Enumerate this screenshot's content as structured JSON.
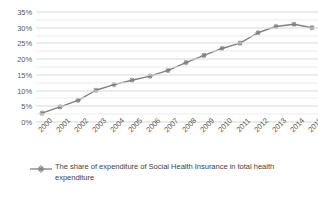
{
  "chart_data": {
    "type": "line",
    "title": "",
    "subtitle": "",
    "xlabel": "",
    "ylabel": "",
    "x": [
      "2000",
      "2001",
      "2002",
      "2003",
      "2004",
      "2005",
      "2006",
      "2007",
      "2008",
      "2009",
      "2010",
      "2011",
      "2012",
      "2013",
      "2014",
      "2015"
    ],
    "categories": [
      "2000",
      "2001",
      "2002",
      "2003",
      "2004",
      "2005",
      "2006",
      "2007",
      "2008",
      "2009",
      "2010",
      "2011",
      "2012",
      "2013",
      "2014",
      "2015"
    ],
    "series": [
      {
        "name": "The share of expenditure of Social Health Insurance in total health expenditure",
        "values": [
          2.8,
          4.8,
          6.9,
          10.1,
          11.9,
          13.3,
          14.6,
          16.4,
          18.9,
          21.2,
          23.4,
          25.1,
          28.4,
          30.4,
          31.1,
          30.0
        ]
      }
    ],
    "ylim": [
      0,
      35
    ],
    "y_ticks": [
      0,
      5,
      10,
      15,
      20,
      25,
      30,
      35
    ],
    "y_tick_labels": [
      "0%",
      "5%",
      "10%",
      "15%",
      "20%",
      "25%",
      "30%",
      "35%"
    ],
    "y_minor_step": 2.5,
    "grid": true,
    "grid_axis": "y",
    "legend_position": "bottom",
    "series_color": "#808080",
    "gridline_color": "#d9d9d9",
    "marker": "star",
    "value_suffix": "%"
  },
  "legend": {
    "entries": [
      {
        "label": "The share of expenditure of Social Health Insurance in total health expenditure"
      }
    ]
  }
}
